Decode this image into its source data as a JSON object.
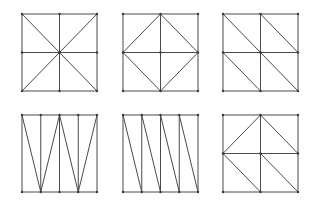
{
  "figure": {
    "stroke_color": "#4a4a4a",
    "node_color": "#3a3a3a",
    "background": "#ffffff"
  },
  "panels": [
    {
      "id": "union-jack",
      "box": {
        "x": 22,
        "y": 14,
        "w": 75,
        "h": 77
      },
      "grid": {
        "cols": 2,
        "rows": 2
      },
      "diagonals": [
        [
          0,
          0,
          2,
          2
        ],
        [
          2,
          0,
          0,
          2
        ]
      ],
      "nodes": [
        [
          0,
          0
        ],
        [
          1,
          0
        ],
        [
          2,
          0
        ],
        [
          0,
          1
        ],
        [
          1,
          1
        ],
        [
          2,
          1
        ],
        [
          0,
          2
        ],
        [
          1,
          2
        ],
        [
          2,
          2
        ]
      ]
    },
    {
      "id": "diamond",
      "box": {
        "x": 123,
        "y": 14,
        "w": 75,
        "h": 77
      },
      "grid": {
        "cols": 2,
        "rows": 2
      },
      "diagonals": [
        [
          1,
          0,
          0,
          1
        ],
        [
          1,
          0,
          2,
          1
        ],
        [
          0,
          1,
          1,
          2
        ],
        [
          2,
          1,
          1,
          2
        ]
      ],
      "nodes": [
        [
          0,
          0
        ],
        [
          1,
          0
        ],
        [
          2,
          0
        ],
        [
          0,
          1
        ],
        [
          1,
          1
        ],
        [
          2,
          1
        ],
        [
          0,
          2
        ],
        [
          1,
          2
        ],
        [
          2,
          2
        ]
      ]
    },
    {
      "id": "regular-diagonal",
      "box": {
        "x": 223,
        "y": 14,
        "w": 75,
        "h": 77
      },
      "grid": {
        "cols": 2,
        "rows": 2
      },
      "diagonals": [
        [
          0,
          0,
          1,
          1
        ],
        [
          1,
          0,
          2,
          1
        ],
        [
          0,
          1,
          1,
          2
        ],
        [
          1,
          1,
          2,
          2
        ]
      ],
      "nodes": [
        [
          0,
          0
        ],
        [
          1,
          0
        ],
        [
          2,
          0
        ],
        [
          0,
          1
        ],
        [
          1,
          1
        ],
        [
          2,
          1
        ],
        [
          0,
          2
        ],
        [
          1,
          2
        ],
        [
          2,
          2
        ]
      ]
    },
    {
      "id": "zigzag-strips",
      "box": {
        "x": 22,
        "y": 115,
        "w": 75,
        "h": 77
      },
      "grid": {
        "cols": 4,
        "rows": 1
      },
      "diagonals": [
        [
          0,
          0,
          1,
          1
        ],
        [
          1,
          1,
          2,
          0
        ],
        [
          2,
          0,
          3,
          1
        ],
        [
          3,
          1,
          4,
          0
        ]
      ],
      "nodes": [
        [
          0,
          0
        ],
        [
          1,
          0
        ],
        [
          2,
          0
        ],
        [
          3,
          0
        ],
        [
          4,
          0
        ],
        [
          0,
          1
        ],
        [
          1,
          1
        ],
        [
          2,
          1
        ],
        [
          3,
          1
        ],
        [
          4,
          1
        ]
      ]
    },
    {
      "id": "parallel-strips",
      "box": {
        "x": 123,
        "y": 115,
        "w": 75,
        "h": 77
      },
      "grid": {
        "cols": 4,
        "rows": 1
      },
      "diagonals": [
        [
          0,
          0,
          1,
          1
        ],
        [
          1,
          0,
          2,
          1
        ],
        [
          2,
          0,
          3,
          1
        ],
        [
          3,
          0,
          4,
          1
        ]
      ],
      "nodes": [
        [
          0,
          0
        ],
        [
          1,
          0
        ],
        [
          2,
          0
        ],
        [
          3,
          0
        ],
        [
          4,
          0
        ],
        [
          0,
          1
        ],
        [
          1,
          1
        ],
        [
          2,
          1
        ],
        [
          3,
          1
        ],
        [
          4,
          1
        ]
      ]
    },
    {
      "id": "mixed-diagonal",
      "box": {
        "x": 223,
        "y": 115,
        "w": 75,
        "h": 77
      },
      "grid": {
        "cols": 2,
        "rows": 2
      },
      "diagonals": [
        [
          1,
          0,
          0,
          1
        ],
        [
          1,
          0,
          2,
          1
        ],
        [
          0,
          1,
          1,
          2
        ],
        [
          1,
          1,
          2,
          2
        ]
      ],
      "nodes": [
        [
          0,
          0
        ],
        [
          1,
          0
        ],
        [
          2,
          0
        ],
        [
          0,
          1
        ],
        [
          1,
          1
        ],
        [
          2,
          1
        ],
        [
          0,
          2
        ],
        [
          1,
          2
        ],
        [
          2,
          2
        ]
      ]
    }
  ]
}
